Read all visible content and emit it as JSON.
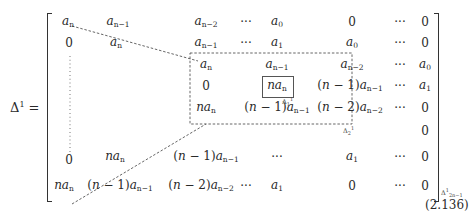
{
  "equation": {
    "lhs": "Δ¹ =",
    "number": "(2.136)",
    "rows": [
      [
        "a_n",
        "a_{n-1}",
        "a_{n-2}",
        "···",
        "a_0",
        "0",
        "···",
        "0"
      ],
      [
        "0",
        "a_n",
        "a_{n-1}",
        "···",
        "a_1",
        "a_0",
        "···",
        "0"
      ],
      [
        "⋮",
        "",
        "a_n",
        "",
        "a_{n-1}",
        "a_{n-2}",
        "···",
        "a_0"
      ],
      [
        "",
        "",
        "0",
        "",
        "na_n",
        "(n − 1)a_{n-1}",
        "···",
        "a_1"
      ],
      [
        "",
        "",
        "na_n",
        "",
        "(n − 1)a_{n-1}",
        "(n − 2)a_{n-2}",
        "···",
        "0"
      ],
      [
        "",
        "",
        "",
        "",
        "",
        "",
        "",
        "0"
      ],
      [
        "0",
        "na_n",
        "(n − 1)a_{n-1}",
        "",
        "···",
        "a_1",
        "···",
        "0"
      ],
      [
        "na_n",
        "(n − 1)a_{n-1}",
        "(n − 2)a_{n-2}",
        "···",
        "a_1",
        "0",
        "···",
        "0"
      ]
    ],
    "labels": {
      "delta1": "Δ₁¹",
      "delta2": "Δ₂¹",
      "delta_last": "Δ¹₂ₙ₋₁"
    }
  }
}
